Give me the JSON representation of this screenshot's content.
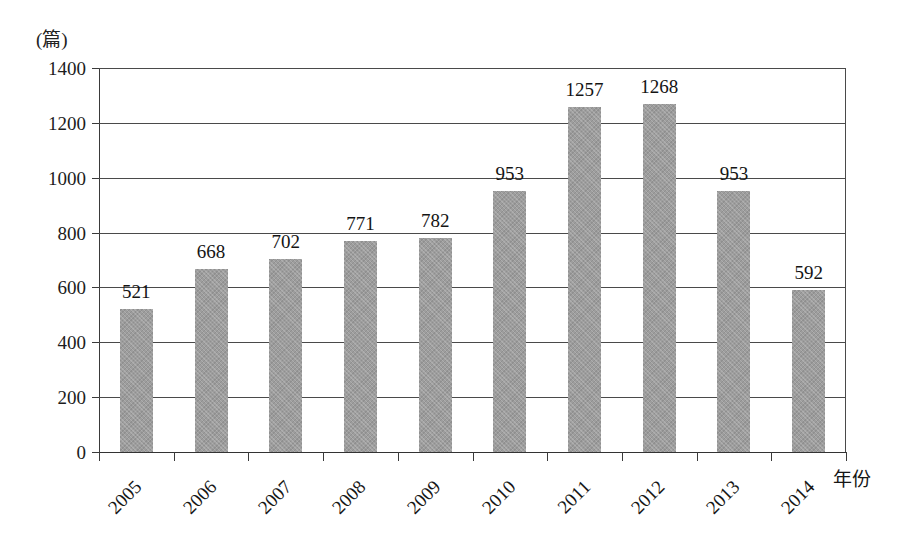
{
  "chart_data": {
    "type": "bar",
    "title": "",
    "subtitle": "",
    "xlabel": "年份",
    "ylabel": "(篇)",
    "categories": [
      "2005",
      "2006",
      "2007",
      "2008",
      "2009",
      "2010",
      "2011",
      "2012",
      "2013",
      "2014"
    ],
    "values": [
      521,
      668,
      702,
      771,
      782,
      953,
      1257,
      1268,
      953,
      592
    ],
    "series": [
      {
        "name": "",
        "values": [
          521,
          668,
          702,
          771,
          782,
          953,
          1257,
          1268,
          953,
          592
        ]
      }
    ],
    "data_labels": [
      "521",
      "668",
      "702",
      "771",
      "782",
      "953",
      "1257",
      "1268",
      "953",
      "592"
    ],
    "ylim": [
      0,
      1400
    ],
    "ytick_values": [
      0,
      200,
      400,
      600,
      800,
      1000,
      1200,
      1400
    ],
    "ytick_labels": [
      "0",
      "200",
      "400",
      "600",
      "800",
      "1000",
      "1200",
      "1400"
    ],
    "grid": true,
    "grid_axis": "y",
    "legend": false,
    "legend_position": "none",
    "bar_color": "#9d9d9d",
    "axis_color": "#3a3a3a",
    "text_color": "#161616",
    "background_color": "#ffffff",
    "annotations": []
  }
}
